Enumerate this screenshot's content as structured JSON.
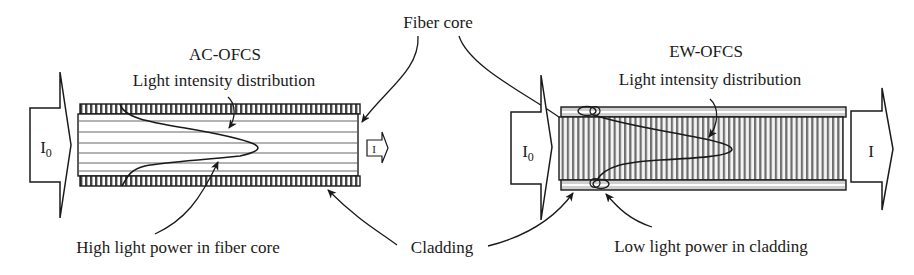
{
  "figure": {
    "type": "comparison-diagram",
    "shared_labels": {
      "fiber_core": "Fiber core",
      "cladding": "Cladding"
    },
    "left_panel": {
      "title": "AC-OFCS",
      "curve_label": "Light intensity distribution",
      "input_label": "I",
      "input_subscript": "0",
      "output_label": "I",
      "bottom_label": "High light power in fiber core"
    },
    "right_panel": {
      "title": "EW-OFCS",
      "curve_label": "Light intensity distribution",
      "input_label": "I",
      "input_subscript": "0",
      "output_label": "I",
      "bottom_label": "Low light power in cladding"
    },
    "colors": {
      "ink": "#1a1a1a",
      "hatch": "#8a8a8a",
      "core_line": "#9a9a9a",
      "cladding_fill": "#cfcfcf"
    }
  }
}
